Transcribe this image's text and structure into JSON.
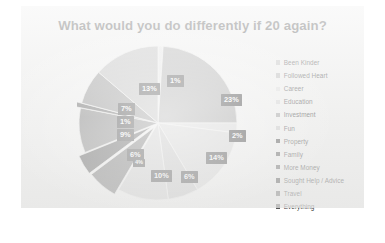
{
  "chart_data": {
    "type": "pie",
    "title": "What would you do differently if 20 again?",
    "xlabel": "",
    "ylabel": "",
    "grid": false,
    "legend_position": "right",
    "categories": [
      "Been Kinder",
      "Followed Heart",
      "Career",
      "Education",
      "Investment",
      "Fun",
      "Property",
      "Family",
      "More Money",
      "Sought Help / Advice",
      "Travel",
      "Everything"
    ],
    "values": [
      1,
      23,
      2,
      14,
      6,
      10,
      6,
      4,
      9,
      1,
      7,
      13
    ],
    "labels": [
      "1%",
      "23%",
      "2%",
      "14%",
      "6%",
      "10%",
      "6%",
      "4%",
      "9%",
      "1%",
      "7%",
      "13%"
    ],
    "colors": [
      "#e3e3e3",
      "#9a9a9a",
      "#d6d6d6",
      "#cfcfcf",
      "#bdbdbd",
      "#c8c8c8",
      "#565656",
      "#3a3a3a",
      "#6e6e6e",
      "#4a4a4a",
      "#7d7d7d",
      "#b0b0b0"
    ]
  },
  "legend": {
    "items": [
      {
        "label": "Been Kinder",
        "color": "#bdbdbd"
      },
      {
        "label": "Followed Heart",
        "color": "#b3b3b3"
      },
      {
        "label": "Career",
        "color": "#dcdcdc"
      },
      {
        "label": "Education",
        "color": "#d2d2d2"
      },
      {
        "label": "Investment",
        "color": "#9e9e9e"
      },
      {
        "label": "Fun",
        "color": "#c6c6c6"
      },
      {
        "label": "Property",
        "color": "#3c3c3c"
      },
      {
        "label": "Family",
        "color": "#4a4a4a"
      },
      {
        "label": "More Money",
        "color": "#565656"
      },
      {
        "label": "Sought Help / Advice",
        "color": "#3f3f3f"
      },
      {
        "label": "Travel",
        "color": "#616161"
      },
      {
        "label": "Everything",
        "color": "#555555"
      }
    ]
  },
  "pie_labels": [
    {
      "text": "1%",
      "x": 90,
      "y": 31,
      "tiny": false
    },
    {
      "text": "23%",
      "x": 144,
      "y": 50,
      "tiny": false
    },
    {
      "text": "2%",
      "x": 152,
      "y": 86,
      "tiny": false
    },
    {
      "text": "14%",
      "x": 129,
      "y": 108,
      "tiny": false
    },
    {
      "text": "6%",
      "x": 104,
      "y": 127,
      "tiny": false
    },
    {
      "text": "10%",
      "x": 74,
      "y": 126,
      "tiny": false
    },
    {
      "text": "6%",
      "x": 50,
      "y": 105,
      "tiny": false
    },
    {
      "text": "4%",
      "x": 56,
      "y": 115,
      "tiny": true
    },
    {
      "text": "9%",
      "x": 40,
      "y": 85,
      "tiny": false
    },
    {
      "text": "1%",
      "x": 40,
      "y": 72,
      "tiny": false
    },
    {
      "text": "7%",
      "x": 41,
      "y": 59,
      "tiny": false
    },
    {
      "text": "13%",
      "x": 62,
      "y": 39,
      "tiny": false
    }
  ]
}
